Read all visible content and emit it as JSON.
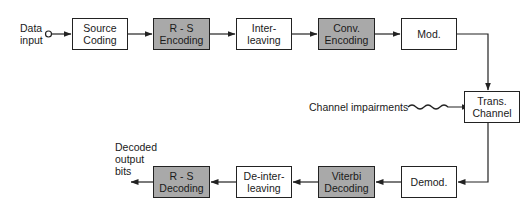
{
  "diagram": {
    "type": "block-diagram",
    "title": "",
    "input_label": "Data\ninput",
    "output_label": "Decoded\noutput\nbits",
    "impairment_label": "Channel impairments",
    "colors": {
      "shaded_fill": "#a9a9a9",
      "plain_fill": "#ffffff",
      "stroke": "#222222"
    },
    "transmit_chain": [
      {
        "id": "source-coding",
        "label": "Source\nCoding",
        "shaded": false
      },
      {
        "id": "rs-encoding",
        "label": "R - S\nEncoding",
        "shaded": true
      },
      {
        "id": "interleaving",
        "label": "Inter-\nleaving",
        "shaded": false
      },
      {
        "id": "conv-encoding",
        "label": "Conv.\nEncoding",
        "shaded": true
      },
      {
        "id": "mod",
        "label": "Mod.",
        "shaded": false
      }
    ],
    "channel": {
      "id": "trans-channel",
      "label": "Trans.\nChannel",
      "shaded": false
    },
    "receive_chain": [
      {
        "id": "demod",
        "label": "Demod.",
        "shaded": false
      },
      {
        "id": "viterbi-decoding",
        "label": "Viterbi\nDecoding",
        "shaded": true
      },
      {
        "id": "deinterleaving",
        "label": "De-inter-\nleaving",
        "shaded": false
      },
      {
        "id": "rs-decoding",
        "label": "R - S\nDecoding",
        "shaded": true
      }
    ],
    "edges": [
      [
        "input",
        "source-coding"
      ],
      [
        "source-coding",
        "rs-encoding"
      ],
      [
        "rs-encoding",
        "interleaving"
      ],
      [
        "interleaving",
        "conv-encoding"
      ],
      [
        "conv-encoding",
        "mod"
      ],
      [
        "mod",
        "trans-channel"
      ],
      [
        "impairments",
        "trans-channel"
      ],
      [
        "trans-channel",
        "demod"
      ],
      [
        "demod",
        "viterbi-decoding"
      ],
      [
        "viterbi-decoding",
        "deinterleaving"
      ],
      [
        "deinterleaving",
        "rs-decoding"
      ],
      [
        "rs-decoding",
        "output"
      ]
    ]
  }
}
